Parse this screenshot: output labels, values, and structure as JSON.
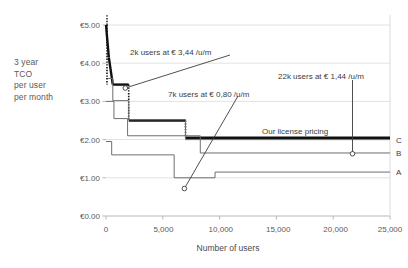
{
  "chart_data": {
    "type": "line",
    "subtype": "step",
    "title": "",
    "ylabel_lines": [
      "3 year",
      "TCO",
      "per user",
      "per month"
    ],
    "xlabel": "Number of users",
    "xlim": [
      0,
      25000
    ],
    "ylim": [
      0,
      5.0
    ],
    "xticks": [
      0,
      5000,
      10000,
      15000,
      20000,
      25000
    ],
    "xticklabels": [
      "0",
      "5,000",
      "10,000",
      "15,000",
      "20,000",
      "25,000"
    ],
    "yticks": [
      0,
      1,
      2,
      3,
      4,
      5
    ],
    "yticklabels": [
      "€0.00",
      "€1.00",
      "€2.00",
      "€3.00",
      "€4.00",
      "€5.00"
    ],
    "grid": "horizontal",
    "legend": "inline-right-labels",
    "currency": "EUR",
    "series": [
      {
        "name": "Our license pricing",
        "label": "Our license pricing",
        "style": "thick-black-step",
        "color": "#111111",
        "steps": [
          {
            "x": 0,
            "y": 5.0
          },
          {
            "x": 250,
            "y": 4.15
          },
          {
            "x": 600,
            "y": 3.44
          },
          {
            "x": 2000,
            "y": 3.44
          },
          {
            "x": 2000,
            "y": 2.5
          },
          {
            "x": 7000,
            "y": 2.5
          },
          {
            "x": 7000,
            "y": 2.05
          },
          {
            "x": 25000,
            "y": 2.05
          }
        ]
      },
      {
        "name": "C",
        "label": "C",
        "style": "thin-grey-step",
        "color": "#6e6e6e",
        "end_value": 2.0,
        "steps": [
          {
            "x": 0,
            "y": 3.6
          },
          {
            "x": 600,
            "y": 3.6
          },
          {
            "x": 600,
            "y": 3.02
          },
          {
            "x": 2000,
            "y": 3.02
          },
          {
            "x": 2000,
            "y": 2.52
          },
          {
            "x": 7000,
            "y": 2.52
          },
          {
            "x": 7000,
            "y": 2.0
          },
          {
            "x": 25000,
            "y": 2.0
          }
        ]
      },
      {
        "name": "B",
        "label": "B",
        "style": "thin-grey-step",
        "color": "#6e6e6e",
        "end_value": 1.65,
        "steps": [
          {
            "x": 0,
            "y": 3.0
          },
          {
            "x": 700,
            "y": 3.0
          },
          {
            "x": 700,
            "y": 2.55
          },
          {
            "x": 1900,
            "y": 2.55
          },
          {
            "x": 1900,
            "y": 2.1
          },
          {
            "x": 8300,
            "y": 2.1
          },
          {
            "x": 8300,
            "y": 1.65
          },
          {
            "x": 25000,
            "y": 1.65
          }
        ]
      },
      {
        "name": "A",
        "label": "A",
        "style": "thin-grey-step",
        "color": "#6e6e6e",
        "end_value": 1.15,
        "steps": [
          {
            "x": 0,
            "y": 1.95
          },
          {
            "x": 500,
            "y": 1.95
          },
          {
            "x": 500,
            "y": 1.6
          },
          {
            "x": 6000,
            "y": 1.6
          },
          {
            "x": 6000,
            "y": 1.0
          },
          {
            "x": 9600,
            "y": 1.0
          },
          {
            "x": 9600,
            "y": 1.15
          },
          {
            "x": 25000,
            "y": 1.15
          }
        ]
      }
    ],
    "annotations": [
      {
        "id": "annot-2k",
        "text": "2k users at € 3,44 /u/m",
        "value": 3.44,
        "users": 2000,
        "marker": {
          "x": 1700,
          "y": 3.35
        },
        "text_pos": {
          "x": 130,
          "y": 48
        }
      },
      {
        "id": "annot-7k",
        "text": "7k users at € 0,80 /u/m",
        "value": 0.8,
        "users": 7000,
        "marker": {
          "x": 6900,
          "y": 0.72
        },
        "text_pos": {
          "x": 168,
          "y": 90
        }
      },
      {
        "id": "annot-22k",
        "text": "22k users at € 1,44 /u/m",
        "value": 1.44,
        "users": 22000,
        "marker": {
          "x": 21700,
          "y": 1.63
        },
        "text_pos": {
          "x": 278,
          "y": 72
        }
      },
      {
        "id": "annot-license",
        "text": "Our license pricing",
        "text_pos": {
          "x": 262,
          "y": 127
        }
      }
    ]
  }
}
